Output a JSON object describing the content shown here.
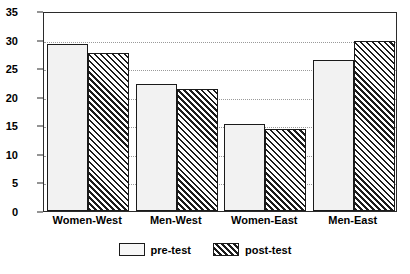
{
  "chart_data": {
    "type": "bar",
    "title": "",
    "subtitle": "",
    "xlabel": "",
    "ylabel": "",
    "categories": [
      "Women-West",
      "Men-West",
      "Women-East",
      "Men-East"
    ],
    "series": [
      {
        "name": "pre-test",
        "values": [
          29.3,
          22.2,
          15.2,
          26.5
        ]
      },
      {
        "name": "post-test",
        "values": [
          27.6,
          21.3,
          14.4,
          29.7
        ]
      }
    ],
    "ylim": [
      0,
      35
    ],
    "ytick_labels": [
      "0",
      "5",
      "10",
      "15",
      "20",
      "25",
      "30",
      "35"
    ],
    "ytick_values": [
      0,
      5,
      10,
      15,
      20,
      25,
      30,
      35
    ],
    "grid": true,
    "grid_axis": "y",
    "grid_style": "dotted",
    "legend_position": "bottom-center",
    "legend": [
      "pre-test",
      "post-test"
    ]
  },
  "legend": {
    "entries": [
      {
        "label": "pre-test",
        "swatch": "dotted-fill-swatch"
      },
      {
        "label": "post-test",
        "swatch": "diagonal-hatch-swatch"
      }
    ]
  },
  "colors": {
    "axis": "#2b2b2b",
    "grid": "#9a9a9a",
    "pre_test_fill": "#f2f2f2",
    "post_test_fill": "#ffffff",
    "hatch": "#1c1c1c",
    "background": "#ffffff"
  }
}
